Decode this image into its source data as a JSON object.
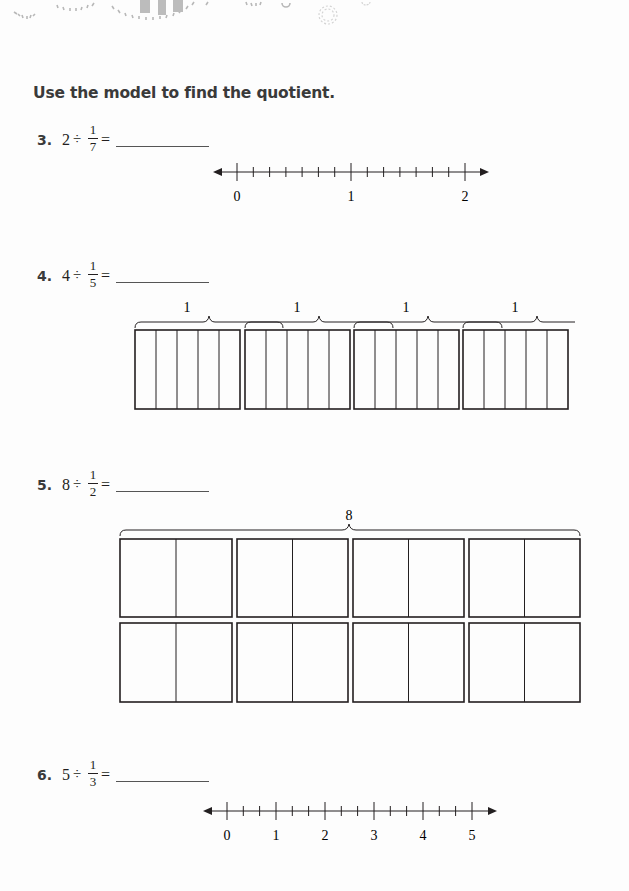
{
  "header": {
    "decoration": "sunburst-pattern"
  },
  "instruction": "Use the model to find the quotient.",
  "problems": [
    {
      "number": "3.",
      "dividend": "2",
      "operator": "÷",
      "fraction": {
        "numerator": "1",
        "denominator": "7"
      },
      "equals": "=",
      "answer": "",
      "model": {
        "type": "number-line",
        "range": [
          0,
          2
        ],
        "subdivisions_per_unit": 7,
        "labels": [
          "0",
          "1",
          "2"
        ]
      }
    },
    {
      "number": "4.",
      "dividend": "4",
      "operator": "÷",
      "fraction": {
        "numerator": "1",
        "denominator": "5"
      },
      "equals": "=",
      "answer": "",
      "model": {
        "type": "fraction-strips",
        "wholes": 4,
        "parts_per_whole": 5,
        "brace_labels": [
          "1",
          "1",
          "1",
          "1"
        ]
      }
    },
    {
      "number": "5.",
      "dividend": "8",
      "operator": "÷",
      "fraction": {
        "numerator": "1",
        "denominator": "2"
      },
      "equals": "=",
      "answer": "",
      "model": {
        "type": "fraction-grid",
        "rows": 2,
        "columns": 4,
        "parts_per_whole": 2,
        "brace_label": "8"
      }
    },
    {
      "number": "6.",
      "dividend": "5",
      "operator": "÷",
      "fraction": {
        "numerator": "1",
        "denominator": "3"
      },
      "equals": "=",
      "answer": "",
      "model": {
        "type": "number-line",
        "range": [
          0,
          5
        ],
        "subdivisions_per_unit": 3,
        "labels": [
          "0",
          "1",
          "2",
          "3",
          "4",
          "5"
        ]
      }
    }
  ]
}
